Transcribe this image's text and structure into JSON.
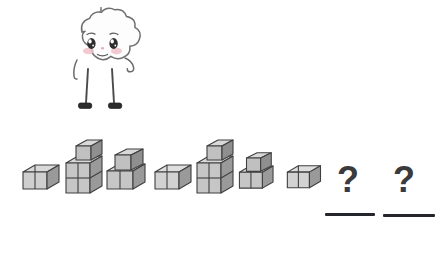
{
  "page": {
    "type": "pattern-sequence-worksheet",
    "background_color": "#ffffff",
    "width": 447,
    "height": 257
  },
  "mascot": {
    "name": "cloud-character",
    "description": "smiling cloud character with a cone on its head, thin arms and legs, black shoes",
    "body_color": "#fdfdfd",
    "outline_color": "#555555",
    "blush_color": "#e8b9c4",
    "shoe_color": "#2b2b2b",
    "cone_color": "#cfcfcf"
  },
  "pattern": {
    "label": "repeating-block-pattern",
    "unit_length": 3,
    "cube_colors": {
      "top": "#d9d9d9",
      "left": "#bdbdbd",
      "right": "#9a9a9a",
      "outline": "#3f3f3f"
    },
    "items": [
      {
        "index": 1,
        "kind": "shape",
        "shape_id": "A",
        "cubes": 2,
        "name": "two-cube-row",
        "x": 14,
        "scale": 1.0
      },
      {
        "index": 2,
        "kind": "shape",
        "shape_id": "B",
        "cubes": 5,
        "name": "four-cube-square-with-top-cube",
        "x": 58,
        "scale": 1.0
      },
      {
        "index": 3,
        "kind": "shape",
        "shape_id": "C",
        "cubes": 3,
        "name": "two-cube-row-with-top-cube",
        "x": 102,
        "scale": 1.0
      },
      {
        "index": 4,
        "kind": "shape",
        "shape_id": "A",
        "cubes": 2,
        "name": "two-cube-row",
        "x": 146,
        "scale": 1.0
      },
      {
        "index": 5,
        "kind": "shape",
        "shape_id": "B",
        "cubes": 5,
        "name": "four-cube-square-with-top-cube",
        "x": 189,
        "scale": 1.0
      },
      {
        "index": 6,
        "kind": "shape",
        "shape_id": "C",
        "cubes": 3,
        "name": "two-cube-row-with-top-cube",
        "x": 234,
        "scale": 0.88
      },
      {
        "index": 7,
        "kind": "shape",
        "shape_id": "A",
        "cubes": 2,
        "name": "two-cube-row",
        "x": 279,
        "scale": 0.92
      },
      {
        "index": 8,
        "kind": "question",
        "symbol": "?",
        "x": 335,
        "answer_line": true
      },
      {
        "index": 9,
        "kind": "question",
        "symbol": "?",
        "x": 391,
        "answer_line": true
      }
    ]
  },
  "question_marks": {
    "symbol": "?",
    "color": "#3b3b3b",
    "count": 2
  },
  "answer_lines": {
    "color": "#24262b",
    "count": 2,
    "width": 50
  }
}
